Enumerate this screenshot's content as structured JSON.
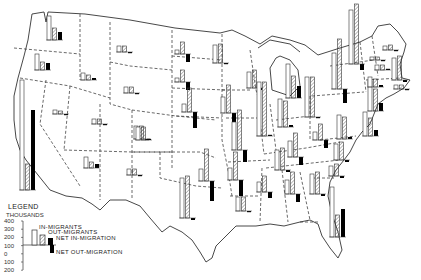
{
  "chart_data": {
    "type": "bar",
    "units": "thousands",
    "legend": {
      "title": "LEGEND",
      "subtitle": "THOUSANDS",
      "entries": [
        {
          "label": "IN-MIGRANTS",
          "style": "open bar"
        },
        {
          "label": "OUT-MIGRANTS",
          "style": "hatched bar"
        },
        {
          "label": "NET IN-MIGRATION",
          "style": "solid black bar above zero"
        },
        {
          "label": "NET OUT-MIGRATION",
          "style": "solid black bar below zero"
        }
      ],
      "y_ticks": [
        400,
        300,
        200,
        100,
        0,
        100,
        200
      ],
      "ylim": [
        -200,
        400
      ],
      "example": {
        "in": 200,
        "out": 130,
        "net": 70
      }
    },
    "series": [
      {
        "name": "In-migrants"
      },
      {
        "name": "Out-migrants"
      },
      {
        "name": "Net migration"
      }
    ],
    "states": [
      {
        "state": "Washington",
        "in": 110,
        "out": 60,
        "net": 50
      },
      {
        "state": "Oregon",
        "in": 80,
        "out": 45,
        "net": 35
      },
      {
        "state": "California",
        "in": 520,
        "out": 130,
        "net": 390
      },
      {
        "state": "Idaho",
        "in": 35,
        "out": 25,
        "net": 10
      },
      {
        "state": "Nevada",
        "in": 15,
        "out": 12,
        "net": 3
      },
      {
        "state": "Montana",
        "in": 30,
        "out": 30,
        "net": -3
      },
      {
        "state": "Wyoming",
        "in": 20,
        "out": 20,
        "net": -2
      },
      {
        "state": "Utah",
        "in": 25,
        "out": 25,
        "net": -4
      },
      {
        "state": "Colorado",
        "in": 75,
        "out": 70,
        "net": 5
      },
      {
        "state": "Arizona",
        "in": 55,
        "out": 30,
        "net": 25
      },
      {
        "state": "New Mexico",
        "in": 35,
        "out": 35,
        "net": -3
      },
      {
        "state": "North Dakota",
        "in": 20,
        "out": 60,
        "net": -40
      },
      {
        "state": "South Dakota",
        "in": 20,
        "out": 60,
        "net": -40
      },
      {
        "state": "Nebraska",
        "in": 40,
        "out": 120,
        "net": -80
      },
      {
        "state": "Kansas",
        "in": 70,
        "out": 70,
        "net": 0
      },
      {
        "state": "Oklahoma",
        "in": 60,
        "out": 160,
        "net": -100
      },
      {
        "state": "Texas",
        "in": 200,
        "out": 210,
        "net": -10
      },
      {
        "state": "Minnesota",
        "in": 90,
        "out": 95,
        "net": -5
      },
      {
        "state": "Iowa",
        "in": 80,
        "out": 140,
        "net": -60
      },
      {
        "state": "Missouri",
        "in": 140,
        "out": 200,
        "net": -60
      },
      {
        "state": "Arkansas",
        "in": 60,
        "out": 140,
        "net": -80
      },
      {
        "state": "Louisiana",
        "in": 70,
        "out": 70,
        "net": -5
      },
      {
        "state": "Wisconsin",
        "in": 80,
        "out": 90,
        "net": -10
      },
      {
        "state": "Illinois",
        "in": 270,
        "out": 270,
        "net": 5
      },
      {
        "state": "Michigan",
        "in": 170,
        "out": 110,
        "net": 60
      },
      {
        "state": "Indiana",
        "in": 140,
        "out": 130,
        "net": 10
      },
      {
        "state": "Ohio",
        "in": 200,
        "out": 200,
        "net": -5
      },
      {
        "state": "Kentucky",
        "in": 80,
        "out": 120,
        "net": -40
      },
      {
        "state": "Tennessee",
        "in": 100,
        "out": 110,
        "net": -10
      },
      {
        "state": "Mississippi",
        "in": 50,
        "out": 80,
        "net": -30
      },
      {
        "state": "Alabama",
        "in": 70,
        "out": 110,
        "net": -40
      },
      {
        "state": "Georgia",
        "in": 100,
        "out": 110,
        "net": -10
      },
      {
        "state": "Florida",
        "in": 250,
        "out": 110,
        "net": 140
      },
      {
        "state": "South Carolina",
        "in": 50,
        "out": 60,
        "net": -10
      },
      {
        "state": "North Carolina",
        "in": 80,
        "out": 90,
        "net": -10
      },
      {
        "state": "Virginia",
        "in": 120,
        "out": 110,
        "net": 10
      },
      {
        "state": "West Virginia",
        "in": 40,
        "out": 80,
        "net": -40
      },
      {
        "state": "Pennsylvania",
        "in": 180,
        "out": 250,
        "net": -70
      },
      {
        "state": "New York",
        "in": 270,
        "out": 300,
        "net": -30
      },
      {
        "state": "New Jersey",
        "in": 150,
        "out": 110,
        "net": 40
      },
      {
        "state": "Maryland",
        "in": 120,
        "out": 90,
        "net": 30
      },
      {
        "state": "Massachusetts",
        "in": 110,
        "out": 120,
        "net": -10
      },
      {
        "state": "Connecticut",
        "in": 70,
        "out": 60,
        "net": 10
      },
      {
        "state": "Maine",
        "in": 20,
        "out": 25,
        "net": -5
      },
      {
        "state": "Vermont",
        "in": 15,
        "out": 15,
        "net": -2
      },
      {
        "state": "New Hampshire",
        "in": 25,
        "out": 25,
        "net": 0
      },
      {
        "state": "Rhode Island",
        "in": 20,
        "out": 20,
        "net": -2
      }
    ]
  },
  "legend": {
    "title": "LEGEND",
    "subtitle": "THOUSANDS",
    "ticks": [
      "400",
      "300",
      "200",
      "100",
      "0",
      "100",
      "200"
    ],
    "labels": {
      "in": "IN-MIGRANTS",
      "out": "OUT-MIGRANTS",
      "net_in": "NET IN-MIGRATION",
      "net_out": "NET OUT-MIGRATION"
    }
  },
  "colors": {
    "border": "#444444",
    "bar_stroke": "#333333",
    "net_fill": "#000000",
    "background": "#ffffff"
  },
  "bars": [
    {
      "id": "WA",
      "x": 47,
      "base": 40,
      "h": [
        24,
        12,
        8
      ]
    },
    {
      "id": "OR",
      "x": 35,
      "base": 70,
      "h": [
        16,
        8,
        7
      ]
    },
    {
      "id": "CA",
      "x": 20,
      "base": 190,
      "h": [
        110,
        26,
        80
      ]
    },
    {
      "id": "ID",
      "x": 81,
      "base": 80,
      "h": [
        7,
        5,
        2
      ]
    },
    {
      "id": "MT",
      "x": 117,
      "base": 52,
      "h": [
        6,
        6,
        -1
      ]
    },
    {
      "id": "NV",
      "x": 53,
      "base": 114,
      "h": [
        4,
        3,
        -1
      ]
    },
    {
      "id": "UT",
      "x": 92,
      "base": 124,
      "h": [
        5,
        5,
        -1
      ]
    },
    {
      "id": "WY",
      "x": 124,
      "base": 93,
      "h": [
        6,
        6,
        -1
      ]
    },
    {
      "id": "CO",
      "x": 134,
      "base": 139,
      "h": [
        13,
        13,
        -1
      ]
    },
    {
      "id": "AZ",
      "x": 84,
      "base": 168,
      "h": [
        11,
        6,
        4
      ]
    },
    {
      "id": "NM",
      "x": 127,
      "base": 175,
      "h": [
        6,
        6,
        -1
      ]
    },
    {
      "id": "ND",
      "x": 175,
      "base": 54,
      "h": [
        4,
        12,
        -8
      ]
    },
    {
      "id": "SD",
      "x": 175,
      "base": 82,
      "h": [
        4,
        12,
        -8
      ]
    },
    {
      "id": "NE",
      "x": 182,
      "base": 112,
      "h": [
        8,
        24,
        -16
      ]
    },
    {
      "id": "KS",
      "x": 136,
      "base": 140,
      "h": [
        13,
        13,
        0
      ]
    },
    {
      "id": "OK",
      "x": 199,
      "base": 181,
      "h": [
        12,
        32,
        -20
      ]
    },
    {
      "id": "TX",
      "x": 180,
      "base": 218,
      "h": [
        40,
        42,
        -2
      ]
    },
    {
      "id": "MN",
      "x": 213,
      "base": 63,
      "h": [
        18,
        19,
        -1
      ]
    },
    {
      "id": "IA",
      "x": 221,
      "base": 113,
      "h": [
        16,
        28,
        -12
      ]
    },
    {
      "id": "MO",
      "x": 232,
      "base": 150,
      "h": [
        28,
        40,
        -12
      ]
    },
    {
      "id": "AR",
      "x": 228,
      "base": 180,
      "h": [
        12,
        28,
        -16
      ]
    },
    {
      "id": "LA",
      "x": 236,
      "base": 211,
      "h": [
        14,
        14,
        -1
      ]
    },
    {
      "id": "WI",
      "x": 247,
      "base": 88,
      "h": [
        16,
        18,
        -2
      ]
    },
    {
      "id": "IL",
      "x": 257,
      "base": 136,
      "h": [
        54,
        54,
        1
      ]
    },
    {
      "id": "MI",
      "x": 286,
      "base": 98,
      "h": [
        34,
        22,
        12
      ]
    },
    {
      "id": "IN",
      "x": 278,
      "base": 127,
      "h": [
        28,
        26,
        2
      ]
    },
    {
      "id": "OH",
      "x": 305,
      "base": 117,
      "h": [
        40,
        40,
        -1
      ]
    },
    {
      "id": "KY",
      "x": 288,
      "base": 157,
      "h": [
        16,
        24,
        -8
      ]
    },
    {
      "id": "TN",
      "x": 275,
      "base": 170,
      "h": [
        20,
        22,
        -2
      ]
    },
    {
      "id": "MS",
      "x": 257,
      "base": 192,
      "h": [
        10,
        16,
        -6
      ]
    },
    {
      "id": "AL",
      "x": 285,
      "base": 194,
      "h": [
        14,
        22,
        -8
      ]
    },
    {
      "id": "GA",
      "x": 310,
      "base": 194,
      "h": [
        20,
        22,
        -2
      ]
    },
    {
      "id": "FL",
      "x": 330,
      "base": 237,
      "h": [
        50,
        22,
        28
      ]
    },
    {
      "id": "SC",
      "x": 329,
      "base": 176,
      "h": [
        10,
        12,
        -2
      ]
    },
    {
      "id": "NC",
      "x": 334,
      "base": 160,
      "h": [
        16,
        18,
        -2
      ]
    },
    {
      "id": "VA",
      "x": 337,
      "base": 139,
      "h": [
        24,
        22,
        2
      ]
    },
    {
      "id": "WV",
      "x": 313,
      "base": 140,
      "h": [
        8,
        16,
        -8
      ]
    },
    {
      "id": "PA",
      "x": 332,
      "base": 89,
      "h": [
        36,
        50,
        -14
      ]
    },
    {
      "id": "NY",
      "x": 349,
      "base": 64,
      "h": [
        54,
        60,
        -6
      ]
    },
    {
      "id": "NJ",
      "x": 368,
      "base": 111,
      "h": [
        30,
        22,
        8
      ]
    },
    {
      "id": "MD",
      "x": 363,
      "base": 136,
      "h": [
        24,
        18,
        6
      ]
    },
    {
      "id": "MA",
      "x": 392,
      "base": 80,
      "h": [
        22,
        24,
        -2
      ]
    },
    {
      "id": "CT",
      "x": 368,
      "base": 87,
      "h": [
        10,
        8,
        2
      ]
    },
    {
      "id": "ME",
      "x": 383,
      "base": 50,
      "h": [
        4,
        5,
        -1
      ]
    },
    {
      "id": "VT",
      "x": 370,
      "base": 60,
      "h": [
        3,
        3,
        -1
      ]
    },
    {
      "id": "NH",
      "x": 375,
      "base": 70,
      "h": [
        5,
        5,
        0
      ]
    },
    {
      "id": "RI",
      "x": 394,
      "base": 89,
      "h": [
        4,
        4,
        -1
      ]
    }
  ]
}
